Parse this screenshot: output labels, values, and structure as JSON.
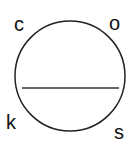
{
  "diagram": {
    "type": "circle-with-chord",
    "circle": {
      "cx": 70,
      "cy": 76,
      "r": 55,
      "stroke": "#222222"
    },
    "chord": {
      "x1": 22,
      "y1": 88,
      "x2": 119,
      "y2": 88,
      "stroke": "#333333"
    },
    "labels": {
      "top_left": "c",
      "top_right": "o",
      "bottom_left": "k",
      "bottom_right": "s"
    }
  }
}
